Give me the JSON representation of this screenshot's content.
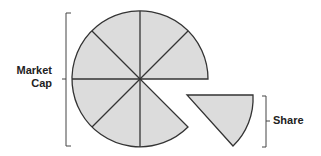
{
  "labels": {
    "market_cap_line1": "Market",
    "market_cap_line2": "Cap",
    "share": "Share"
  },
  "diagram": {
    "total_slices": 8,
    "detached_slices": 1,
    "fill_color": "#dcdcdc",
    "stroke_color": "#333333"
  }
}
